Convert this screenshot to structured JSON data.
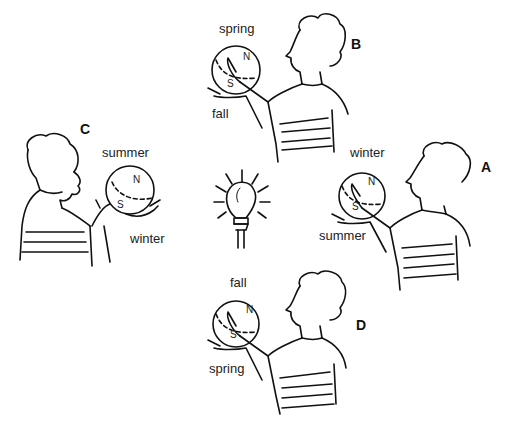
{
  "figure": {
    "light_source": "light-bulb",
    "positions": [
      {
        "letter": "B",
        "top_label": "spring",
        "bottom_label": "fall",
        "north": "N",
        "south": "S"
      },
      {
        "letter": "C",
        "top_label": "summer",
        "bottom_label": "winter",
        "north": "N",
        "south": "S"
      },
      {
        "letter": "A",
        "top_label": "winter",
        "bottom_label": "summer",
        "north": "N",
        "south": "S"
      },
      {
        "letter": "D",
        "top_label": "fall",
        "bottom_label": "spring",
        "north": "N",
        "south": "S"
      }
    ]
  }
}
